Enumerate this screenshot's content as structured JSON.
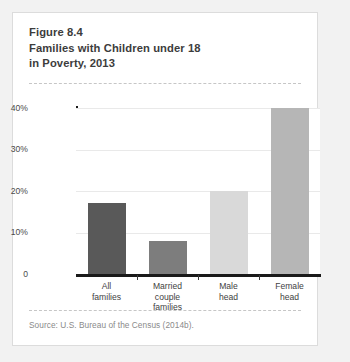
{
  "card": {
    "title_lines": [
      "Figure 8.4",
      "Families with Children under 18",
      "in Poverty, 2013"
    ],
    "source": "Source: U.S. Bureau of the Census (2014b)."
  },
  "chart_data": {
    "type": "bar",
    "title": "Families with Children under 18 in Poverty, 2013",
    "figure_number": "Figure 8.4",
    "categories": [
      "All\nfamilies",
      "Married\ncouple\nfamilies",
      "Male\nhead",
      "Female\nhead"
    ],
    "category_lines": [
      [
        "All",
        "families"
      ],
      [
        "Married",
        "couple",
        "families"
      ],
      [
        "Male",
        "head"
      ],
      [
        "Female",
        "head"
      ]
    ],
    "values": [
      17,
      8,
      20,
      40
    ],
    "bar_colors": [
      "#595959",
      "#7d7d7d",
      "#d9d9d9",
      "#b6b6b6"
    ],
    "xlabel": "",
    "ylabel": "Percentage in poverty",
    "ylim": [
      0,
      40
    ],
    "yticks": [
      0,
      10,
      20,
      30,
      40
    ],
    "ytick_labels": [
      "0",
      "10%",
      "20%",
      "30%",
      "40%"
    ],
    "grid": true,
    "legend": "none"
  },
  "colors": {
    "page_background": "#f2f2f2",
    "card_background": "#ffffff",
    "card_border": "#dcdcdc",
    "axis": "#1a1a1a",
    "gridline": "#e9e9e9",
    "title_text": "#3c3c3c",
    "source_text": "#8a8a8a"
  }
}
